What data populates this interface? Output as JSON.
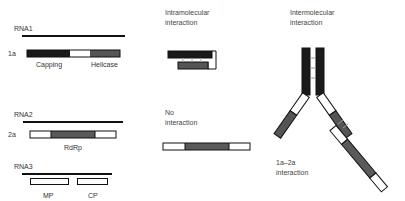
{
  "colors": {
    "rna_line": "#111111",
    "capping": "#1a1a1a",
    "helicase": "#555555",
    "rdrp": "#5a5a5a",
    "blank": "#ffffff",
    "outline": "#111111",
    "text": "#333333"
  },
  "left": {
    "rna1": {
      "label": "RNA1",
      "protein_label": "1a",
      "domains": [
        "Capping",
        "Helicase"
      ]
    },
    "rna2": {
      "label": "RNA2",
      "protein_label": "2a",
      "domains": [
        "RdRp"
      ]
    },
    "rna3": {
      "label": "RNA3",
      "proteins": [
        "MP",
        "CP"
      ]
    }
  },
  "middle": {
    "intramolecular": {
      "label": "Intramolecular\ninteraction"
    },
    "none": {
      "label": "No\ninteraction"
    }
  },
  "right": {
    "intermolecular": {
      "label": "Intermolecular\ninteraction"
    },
    "pair": {
      "label": "1a–2a\ninteraction"
    }
  }
}
